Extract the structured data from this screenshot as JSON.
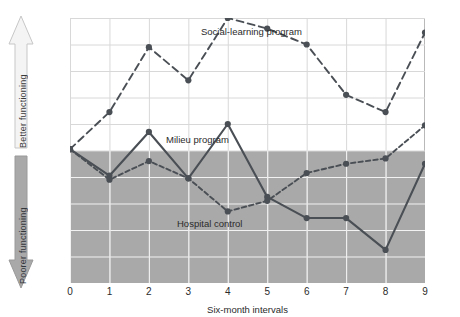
{
  "axes": {
    "better_label": "Better functioning",
    "poorer_label": "Poorer functioning",
    "xlabel": "Six-month intervals",
    "yticks": [
      "+5.00",
      "+4.00",
      "+3.00",
      "+2.00",
      "+1.00",
      "0.00",
      "-1.00",
      "-2.00",
      "-3.00",
      "-4.00",
      "-5.00"
    ],
    "xticks": [
      "0",
      "1",
      "2",
      "3",
      "4",
      "5",
      "6",
      "7",
      "8",
      "9"
    ]
  },
  "annotations": {
    "social": "Social-learning program",
    "milieu": "Milieu program",
    "hospital": "Hospital control"
  },
  "colors": {
    "ink": "#4a4f55",
    "neg_band": "#a9a9a9",
    "grid": "#d8d8d8",
    "grid_on_band": "#f2f2f2",
    "frame": "#b9b9b9",
    "arrow_up": "#f0f0f0",
    "arrow_down": "#a9a9a9"
  },
  "chart_data": {
    "type": "line",
    "title": "",
    "xlabel": "Six-month intervals",
    "ylabel": "",
    "xlim": [
      0,
      9
    ],
    "ylim": [
      -5,
      5
    ],
    "grid": true,
    "legend": "inline-annotations",
    "x": [
      0,
      1,
      2,
      3,
      4,
      5,
      6,
      7,
      8,
      9
    ],
    "series": [
      {
        "name": "Social-learning program",
        "style": "dashed",
        "values": [
          0.05,
          1.45,
          3.9,
          2.65,
          5.0,
          4.6,
          4.0,
          2.1,
          1.45,
          4.45
        ]
      },
      {
        "name": "Milieu program",
        "style": "solid",
        "values": [
          0.05,
          -0.95,
          0.7,
          -1.05,
          1.0,
          -1.75,
          -2.55,
          -2.55,
          -3.75,
          -0.5
        ]
      },
      {
        "name": "Hospital control",
        "style": "dotted-dashed",
        "values": [
          0.05,
          -1.1,
          -0.4,
          -1.05,
          -2.3,
          -1.9,
          -0.85,
          -0.5,
          -0.3,
          0.95
        ]
      }
    ]
  }
}
